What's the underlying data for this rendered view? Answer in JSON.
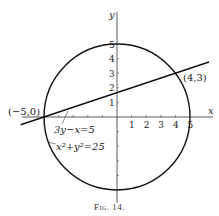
{
  "figure": {
    "caption": "Fig. 14.",
    "axes": {
      "x_label": "x",
      "y_label": "y",
      "x_ticks": [
        "1",
        "2",
        "3",
        "4",
        "5"
      ],
      "y_ticks": [
        "1",
        "2",
        "3",
        "4",
        "5"
      ],
      "x_tick_values": [
        1,
        2,
        3,
        4,
        5
      ],
      "y_tick_values": [
        1,
        2,
        3,
        4,
        5
      ],
      "minor_ticks_negative_x": [
        -4,
        -3,
        -2,
        -1
      ],
      "minor_ticks_negative_y": [
        -1,
        -2,
        -3,
        -4
      ]
    },
    "curves": [
      {
        "name": "circle",
        "equation": "x²+y²=25",
        "center": [
          0,
          0
        ],
        "radius": 5
      },
      {
        "name": "line",
        "equation": "3y−x=5",
        "slope": 0.3333,
        "intercept": 1.6667
      }
    ],
    "points": [
      {
        "label": "(−5,0)",
        "x": -5,
        "y": 0
      },
      {
        "label": "(4,3)",
        "x": 4,
        "y": 3
      }
    ],
    "labels": {
      "line_eq_a": "3y−x=5",
      "circle_eq": "x²+y²=25"
    }
  }
}
